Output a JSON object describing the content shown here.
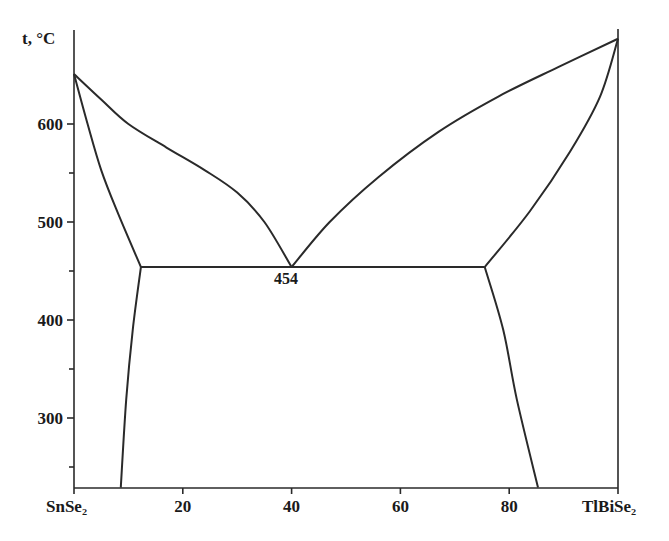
{
  "chart_data": {
    "type": "line",
    "title": "",
    "subtitle": "Phase diagram of the SnSe2–TlBiSe2 system",
    "xlabel": "",
    "ylabel": "t, °C",
    "x_left_label": "SnSe₂",
    "x_right_label": "TlBiSe₂",
    "xlim": [
      0,
      100
    ],
    "ylim": [
      229,
      700
    ],
    "x_ticks": [
      20,
      40,
      60,
      80
    ],
    "y_ticks": [
      300,
      400,
      500,
      600
    ],
    "y_minor_ticks": [
      250,
      350,
      450,
      550
    ],
    "grid": false,
    "legend": null,
    "annotations": [
      {
        "text": "454",
        "x": 40,
        "y": 454
      }
    ],
    "series": [
      {
        "name": "liquidus-left",
        "points": [
          [
            0,
            651
          ],
          [
            5,
            625
          ],
          [
            10,
            600
          ],
          [
            17,
            576
          ],
          [
            24,
            553
          ],
          [
            30,
            530
          ],
          [
            35,
            500
          ],
          [
            40,
            454
          ]
        ]
      },
      {
        "name": "liquidus-right",
        "points": [
          [
            40,
            454
          ],
          [
            47,
            500
          ],
          [
            56,
            546
          ],
          [
            67,
            592
          ],
          [
            78,
            628
          ],
          [
            89,
            658
          ],
          [
            100,
            687
          ]
        ]
      },
      {
        "name": "solidus-left",
        "points": [
          [
            0,
            651
          ],
          [
            2.5,
            600
          ],
          [
            5,
            553
          ],
          [
            8,
            510
          ],
          [
            12.3,
            454
          ]
        ]
      },
      {
        "name": "solidus-right",
        "points": [
          [
            75.5,
            454
          ],
          [
            83.8,
            511
          ],
          [
            91.2,
            572
          ],
          [
            96.7,
            628
          ],
          [
            100,
            687
          ]
        ]
      },
      {
        "name": "eutectic-line",
        "points": [
          [
            12.3,
            454
          ],
          [
            75.5,
            454
          ]
        ]
      },
      {
        "name": "solvus-left",
        "points": [
          [
            12.3,
            454
          ],
          [
            10.8,
            390
          ],
          [
            9.6,
            319
          ],
          [
            8.6,
            229
          ]
        ]
      },
      {
        "name": "solvus-right",
        "points": [
          [
            75.5,
            454
          ],
          [
            78.9,
            390
          ],
          [
            81.4,
            319
          ],
          [
            85.3,
            229
          ]
        ]
      }
    ]
  },
  "labels": {
    "y_axis_title": "t, °C",
    "x_left": "SnSe₂",
    "x_right": "TlBiSe₂",
    "eutectic": "454",
    "ticks_x": [
      "20",
      "40",
      "60",
      "80"
    ],
    "ticks_y": [
      "600",
      "500",
      "400",
      "300"
    ]
  }
}
